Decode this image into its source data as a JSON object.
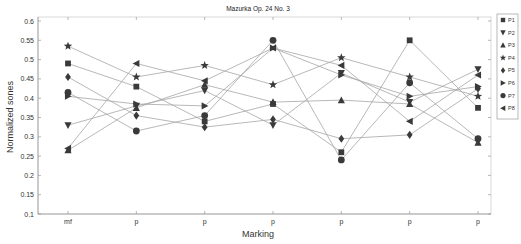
{
  "chart_data": {
    "type": "line",
    "title": "Mazurka Op. 24 No. 3",
    "xlabel": "Marking",
    "ylabel": "Normalized sones",
    "categories": [
      "mf",
      "p",
      "p",
      "p",
      "p",
      "p",
      "p"
    ],
    "ylim": [
      0.1,
      0.6
    ],
    "yticks": [
      0.1,
      0.15,
      0.2,
      0.25,
      0.3,
      0.35,
      0.4,
      0.45,
      0.5,
      0.55,
      0.6
    ],
    "grid": false,
    "legend_position": "right-outside",
    "series": [
      {
        "name": "P1",
        "marker": "square",
        "values": [
          0.49,
          0.43,
          0.34,
          0.385,
          0.26,
          0.55,
          0.375
        ]
      },
      {
        "name": "P2",
        "marker": "triangle-down",
        "values": [
          0.33,
          0.38,
          0.42,
          0.33,
          0.465,
          0.39,
          0.475
        ]
      },
      {
        "name": "P3",
        "marker": "triangle-up",
        "values": [
          0.265,
          0.375,
          0.435,
          0.39,
          0.395,
          0.385,
          0.285
        ]
      },
      {
        "name": "P4",
        "marker": "star",
        "values": [
          0.535,
          0.455,
          0.485,
          0.435,
          0.505,
          0.455,
          0.405
        ]
      },
      {
        "name": "P5",
        "marker": "diamond",
        "values": [
          0.455,
          0.355,
          0.325,
          0.345,
          0.295,
          0.305,
          0.425
        ]
      },
      {
        "name": "P6",
        "marker": "triangle-right",
        "values": [
          0.405,
          0.385,
          0.38,
          0.53,
          0.46,
          0.405,
          0.43
        ]
      },
      {
        "name": "P7",
        "marker": "circle",
        "values": [
          0.415,
          0.315,
          0.355,
          0.55,
          0.24,
          0.44,
          0.295
        ]
      },
      {
        "name": "P8",
        "marker": "triangle-left",
        "values": [
          0.27,
          0.49,
          0.445,
          0.53,
          0.485,
          0.34,
          0.46
        ]
      }
    ]
  },
  "legend": {
    "items": [
      "P1",
      "P2",
      "P3",
      "P4",
      "P5",
      "P6",
      "P7",
      "P8"
    ]
  },
  "colors": {
    "line": "#a6a6a6",
    "marker": "#3a3a3a",
    "axis": "#9a9a9a"
  }
}
